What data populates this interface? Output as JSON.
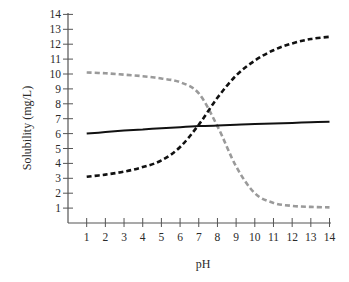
{
  "chart_data": {
    "type": "line",
    "title": "",
    "xlabel": "pH",
    "ylabel": "Solubility (mg/L)",
    "xlim": [
      0,
      14
    ],
    "ylim": [
      0,
      14
    ],
    "grid": false,
    "legend": null,
    "x": [
      1,
      2,
      3,
      4,
      5,
      6,
      7,
      8,
      9,
      10,
      11,
      12,
      13,
      14
    ],
    "x_ticks": [
      "1",
      "2",
      "3",
      "4",
      "5",
      "6",
      "7",
      "8",
      "9",
      "10",
      "11",
      "12",
      "13",
      "14"
    ],
    "y_ticks": [
      "1",
      "2",
      "3",
      "4",
      "5",
      "6",
      "7",
      "8",
      "9",
      "10",
      "11",
      "12",
      "13",
      "14"
    ],
    "series": [
      {
        "name": "solid-black",
        "style": "solid",
        "color": "#111111",
        "values": [
          6.0,
          6.1,
          6.2,
          6.28,
          6.36,
          6.43,
          6.5,
          6.55,
          6.6,
          6.64,
          6.68,
          6.72,
          6.76,
          6.8
        ]
      },
      {
        "name": "dashed-black",
        "style": "dashed",
        "color": "#111111",
        "values": [
          3.1,
          3.25,
          3.45,
          3.75,
          4.2,
          5.1,
          6.6,
          8.4,
          9.9,
          10.9,
          11.6,
          12.05,
          12.35,
          12.5
        ]
      },
      {
        "name": "dashed-gray",
        "style": "dashed",
        "color": "#9a9a9a",
        "values": [
          10.1,
          10.05,
          9.95,
          9.85,
          9.7,
          9.45,
          8.7,
          6.5,
          3.8,
          2.0,
          1.35,
          1.15,
          1.08,
          1.05
        ]
      }
    ]
  }
}
